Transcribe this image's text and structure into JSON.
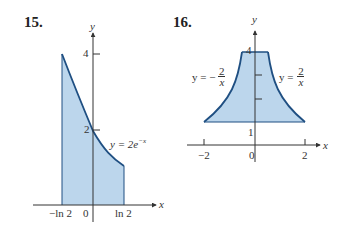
{
  "figure_15": {
    "number": "15.",
    "x_axis_label": "x",
    "y_axis_label": "y",
    "y_ticks": [
      "4",
      "2"
    ],
    "x_ticks": [
      "−ln 2",
      "0",
      "ln 2"
    ],
    "curve_label": "y = 2e",
    "curve_label_exp": "−x",
    "fill_color": "#bcd6ec",
    "curve_color": "#1f4f82"
  },
  "figure_16": {
    "number": "16.",
    "x_axis_label": "x",
    "y_axis_label": "y",
    "y_ticks": [
      "4",
      "1"
    ],
    "x_ticks": [
      "−2",
      "0",
      "2"
    ],
    "left_curve_label_prefix": "y = −",
    "left_curve_num": "2",
    "left_curve_den": "x",
    "right_curve_label_prefix": "y =",
    "right_curve_num": "2",
    "right_curve_den": "x",
    "fill_color": "#bcd6ec",
    "curve_color": "#1f4f82"
  }
}
